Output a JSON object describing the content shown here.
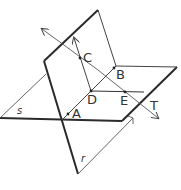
{
  "diagram": {
    "colors": {
      "stroke": "#2a2a2a",
      "thin": "#555555",
      "background": "#ffffff"
    },
    "planes": [
      {
        "id": "s",
        "label": "s"
      },
      {
        "id": "r",
        "label": "r"
      }
    ],
    "points": [
      {
        "id": "A",
        "label": "A"
      },
      {
        "id": "B",
        "label": "B"
      },
      {
        "id": "C",
        "label": "C"
      },
      {
        "id": "D",
        "label": "D"
      },
      {
        "id": "E",
        "label": "E"
      }
    ],
    "lines": [
      {
        "id": "T",
        "label": "T"
      }
    ]
  }
}
